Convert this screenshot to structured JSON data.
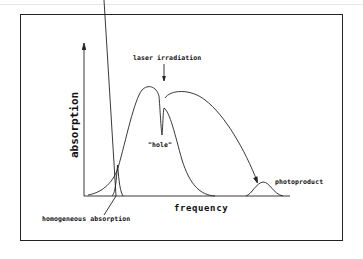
{
  "diagram": {
    "axes": {
      "x_label": "frequency",
      "y_label": "absorption"
    },
    "annotations": {
      "laser": "laser irradiation",
      "hole": "\"hole\"",
      "photoproduct": "photoproduct",
      "homogeneous": "homogeneous absorption"
    },
    "colors": {
      "line": "#222222",
      "background": "#ffffff"
    }
  }
}
